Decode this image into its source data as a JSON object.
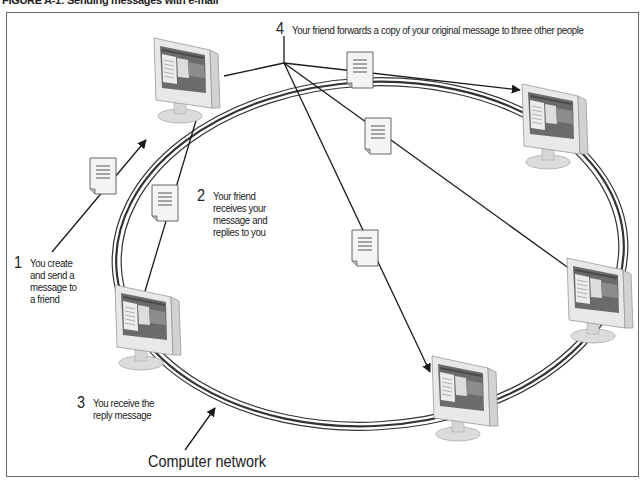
{
  "figure": {
    "title": "FIGURE A-1: Sending messages with e-mail"
  },
  "steps": [
    {
      "number": "1",
      "text": "You create\nand send a\nmessage to\na friend"
    },
    {
      "number": "2",
      "text": "Your friend\nreceives your\nmessage and\nreplies to you"
    },
    {
      "number": "3",
      "text": "You receive the\nreply message"
    },
    {
      "number": "4",
      "text": "Your friend forwards a copy of your original message to three other people"
    }
  ],
  "network_label": "Computer network",
  "nodes": [
    {
      "id": "friend",
      "icon": "monitor-icon"
    },
    {
      "id": "you",
      "icon": "monitor-icon"
    },
    {
      "id": "recipient-1",
      "icon": "monitor-icon"
    },
    {
      "id": "recipient-2",
      "icon": "monitor-icon"
    },
    {
      "id": "recipient-3",
      "icon": "monitor-icon"
    }
  ],
  "messages": [
    {
      "id": "msg-send",
      "icon": "document-icon"
    },
    {
      "id": "msg-reply",
      "icon": "document-icon"
    },
    {
      "id": "msg-forward-1",
      "icon": "document-icon"
    },
    {
      "id": "msg-forward-2",
      "icon": "document-icon"
    },
    {
      "id": "msg-forward-3",
      "icon": "document-icon"
    }
  ],
  "colors": {
    "line": "#1a1a1a",
    "ring": "#333333",
    "monitor_body": "#e6e6e6",
    "document_fill": "#f2f2f2"
  }
}
